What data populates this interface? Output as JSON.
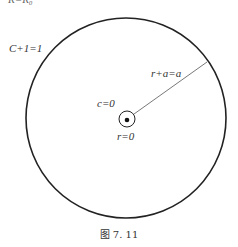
{
  "figure": {
    "top_partial_text": "R=R₀",
    "labels": {
      "outer_circle": "C+1=1",
      "radius": "r+a=a",
      "inner_c": "c=0",
      "inner_r": "r=0"
    },
    "caption": "图 7. 11",
    "colors": {
      "stroke": "#222222",
      "text": "#333333"
    }
  }
}
